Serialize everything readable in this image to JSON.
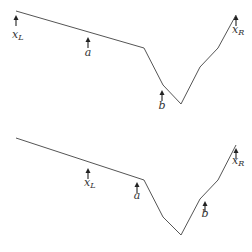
{
  "panels": [
    {
      "id": "top",
      "polyline": [
        [
          16,
          11
        ],
        [
          144,
          48
        ],
        [
          163,
          85
        ],
        [
          181,
          104
        ],
        [
          200,
          67
        ],
        [
          218,
          48
        ],
        [
          236,
          15
        ]
      ],
      "markers": [
        {
          "name": "x_L",
          "base": "x",
          "sub": "L",
          "x": 16,
          "tip_y": 15,
          "label_y": 38
        },
        {
          "name": "a",
          "base": "a",
          "sub": "",
          "x": 88,
          "tip_y": 37,
          "label_y": 56
        },
        {
          "name": "b",
          "base": "b",
          "sub": "",
          "x": 162,
          "tip_y": 90,
          "label_y": 109
        },
        {
          "name": "x_R",
          "base": "x",
          "sub": "R",
          "x": 236,
          "tip_y": 15,
          "label_y": 33
        }
      ]
    },
    {
      "id": "bottom",
      "polyline": [
        [
          16,
          138
        ],
        [
          144,
          180
        ],
        [
          163,
          217
        ],
        [
          181,
          235
        ],
        [
          200,
          199
        ],
        [
          218,
          180
        ],
        [
          236,
          145
        ]
      ],
      "markers": [
        {
          "name": "x_L",
          "base": "x",
          "sub": "L",
          "x": 88,
          "tip_y": 168,
          "label_y": 186
        },
        {
          "name": "a",
          "base": "a",
          "sub": "",
          "x": 137,
          "tip_y": 182,
          "label_y": 199
        },
        {
          "name": "b",
          "base": "b",
          "sub": "",
          "x": 205,
          "tip_y": 201,
          "label_y": 217
        },
        {
          "name": "x_R",
          "base": "x",
          "sub": "R",
          "x": 236,
          "tip_y": 148,
          "label_y": 164
        }
      ]
    }
  ]
}
